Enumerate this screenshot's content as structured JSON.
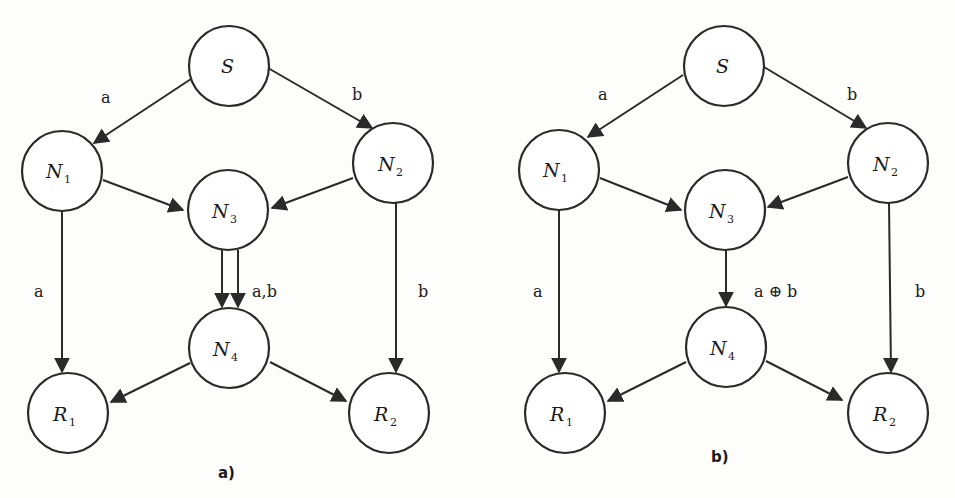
{
  "diagrams": [
    {
      "caption": "a)",
      "nodes": [
        {
          "id": "S",
          "label": "S",
          "sub": ""
        },
        {
          "id": "N1",
          "label": "N",
          "sub": "1"
        },
        {
          "id": "N2",
          "label": "N",
          "sub": "2"
        },
        {
          "id": "N3",
          "label": "N",
          "sub": "3"
        },
        {
          "id": "N4",
          "label": "N",
          "sub": "4"
        },
        {
          "id": "R1",
          "label": "R",
          "sub": "1"
        },
        {
          "id": "R2",
          "label": "R",
          "sub": "2"
        }
      ],
      "edge_labels": {
        "s_n1": "a",
        "s_n2": "b",
        "n1_r1": "a",
        "n2_r2": "b",
        "n3_n4": "a,b"
      }
    },
    {
      "caption": "b)",
      "nodes": [
        {
          "id": "S",
          "label": "S",
          "sub": ""
        },
        {
          "id": "N1",
          "label": "N",
          "sub": "1"
        },
        {
          "id": "N2",
          "label": "N",
          "sub": "2"
        },
        {
          "id": "N3",
          "label": "N",
          "sub": "3"
        },
        {
          "id": "N4",
          "label": "N",
          "sub": "4"
        },
        {
          "id": "R1",
          "label": "R",
          "sub": "1"
        },
        {
          "id": "R2",
          "label": "R",
          "sub": "2"
        }
      ],
      "edge_labels": {
        "s_n1": "a",
        "s_n2": "b",
        "n1_r1": "a",
        "n2_r2": "b",
        "n3_n4": "a ⊕ b"
      }
    }
  ]
}
